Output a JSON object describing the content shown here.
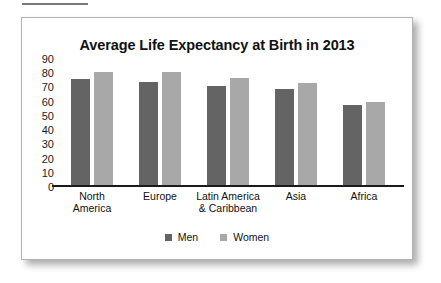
{
  "card": {
    "title": "Average Life Expectancy at Birth in 2013"
  },
  "chart_data": {
    "type": "bar",
    "title": "Average Life Expectancy at Birth in 2013",
    "xlabel": "",
    "ylabel": "",
    "ylim": [
      0,
      90
    ],
    "yticks": [
      90,
      80,
      70,
      60,
      50,
      40,
      30,
      20,
      10,
      0
    ],
    "grid": false,
    "legend_position": "bottom",
    "categories": [
      "North\nAmerica",
      "Europe",
      "Latin America\n& Caribbean",
      "Asia",
      "Africa"
    ],
    "series": [
      {
        "name": "Men",
        "color": "#646464",
        "values": [
          76,
          74,
          71,
          69,
          58
        ]
      },
      {
        "name": "Women",
        "color": "#a8a8a8",
        "values": [
          81,
          81,
          77,
          73,
          60
        ]
      }
    ]
  }
}
